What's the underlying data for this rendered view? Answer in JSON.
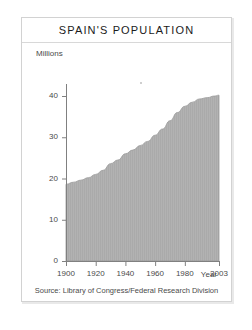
{
  "card": {
    "title": "SPAIN'S POPULATION",
    "source": "Source: Library of Congress/Federal Research Division"
  },
  "chart_data": {
    "type": "area",
    "title": "SPAIN'S POPULATION",
    "xlabel": "Year",
    "ylabel": "Millions",
    "yunit_label": "Millions",
    "xlim": [
      1900,
      2003
    ],
    "ylim": [
      0,
      45
    ],
    "grid": false,
    "legend": "none",
    "fill_color": "#b0b0b0",
    "line_color": "#9a9a9a",
    "axis_color": "#808080",
    "x_ticks": [
      1900,
      1920,
      1940,
      1960,
      1980,
      2003
    ],
    "x_tick_labels": [
      "1900",
      "1920",
      "1940",
      "1960",
      "1980",
      "2003"
    ],
    "y_ticks": [
      0,
      10,
      20,
      30,
      40
    ],
    "y_tick_labels": [
      "0",
      "10",
      "20",
      "30",
      "40"
    ],
    "x": [
      1900,
      1905,
      1910,
      1915,
      1920,
      1925,
      1930,
      1935,
      1940,
      1945,
      1950,
      1955,
      1960,
      1965,
      1970,
      1975,
      1980,
      1985,
      1990,
      1995,
      2000,
      2003
    ],
    "values": [
      18.6,
      19.1,
      19.6,
      20.2,
      21.0,
      22.0,
      23.6,
      24.5,
      26.0,
      26.9,
      28.0,
      29.0,
      30.5,
      32.0,
      34.0,
      36.0,
      37.5,
      38.5,
      39.3,
      39.6,
      40.0,
      40.2
    ],
    "series": [
      {
        "name": "Population (millions)",
        "values": [
          18.6,
          19.1,
          19.6,
          20.2,
          21.0,
          22.0,
          23.6,
          24.5,
          26.0,
          26.9,
          28.0,
          29.0,
          30.5,
          32.0,
          34.0,
          36.0,
          37.5,
          38.5,
          39.3,
          39.6,
          40.0,
          40.2
        ]
      }
    ]
  }
}
